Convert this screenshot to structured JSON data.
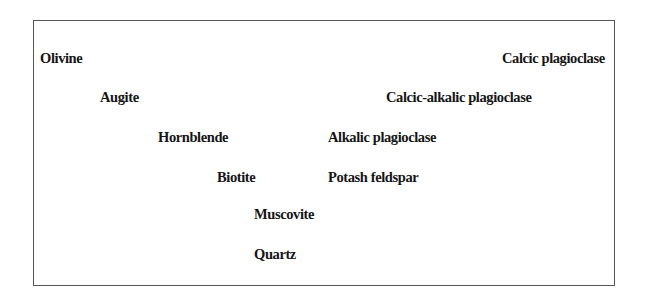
{
  "diagram": {
    "type": "bowen-reaction-series",
    "discontinuous_series": [
      {
        "id": "olivine",
        "label": "Olivine",
        "x": 40,
        "y": 51
      },
      {
        "id": "augite",
        "label": "Augite",
        "x": 100,
        "y": 90
      },
      {
        "id": "hornblende",
        "label": "Hornblende",
        "x": 158,
        "y": 130
      },
      {
        "id": "biotite",
        "label": "Biotite",
        "x": 217,
        "y": 170
      }
    ],
    "continuous_series": [
      {
        "id": "calcic-plagioclase",
        "label": "Calcic plagioclase",
        "x": 502,
        "y": 51
      },
      {
        "id": "calcic-alkalic-plagioclase",
        "label": "Calcic-alkalic plagioclase",
        "x": 386,
        "y": 90
      },
      {
        "id": "alkalic-plagioclase",
        "label": "Alkalic plagioclase",
        "x": 328,
        "y": 130
      },
      {
        "id": "potash-feldspar",
        "label": "Potash feldspar",
        "x": 328,
        "y": 170
      }
    ],
    "final_minerals": [
      {
        "id": "muscovite",
        "label": "Muscovite",
        "x": 254,
        "y": 207
      },
      {
        "id": "quartz",
        "label": "Quartz",
        "x": 254,
        "y": 247
      }
    ]
  }
}
